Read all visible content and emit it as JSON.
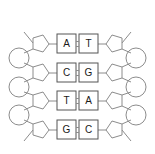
{
  "diagram": {
    "colors": {
      "background": "#ffffff",
      "outline": "#8c8c8c",
      "base_box_outline": "#555555",
      "letter": "#1a1a1a"
    },
    "legend_icons": {
      "phosphate": "circle-icon",
      "sugar": "pentagon-icon",
      "base": "square-icon",
      "hydrogen_bond": "double-line-icon"
    },
    "rungs": [
      {
        "index": 1,
        "left_base": "A",
        "right_base": "T",
        "bond_count": 2
      },
      {
        "index": 2,
        "left_base": "C",
        "right_base": "G",
        "bond_count": 2
      },
      {
        "index": 3,
        "left_base": "T",
        "right_base": "A",
        "bond_count": 2
      },
      {
        "index": 4,
        "left_base": "G",
        "right_base": "C",
        "bond_count": 2
      }
    ],
    "strands": {
      "left_sequence": "A C T G",
      "right_sequence": "T G A C",
      "left_label": "",
      "right_label": ""
    }
  }
}
